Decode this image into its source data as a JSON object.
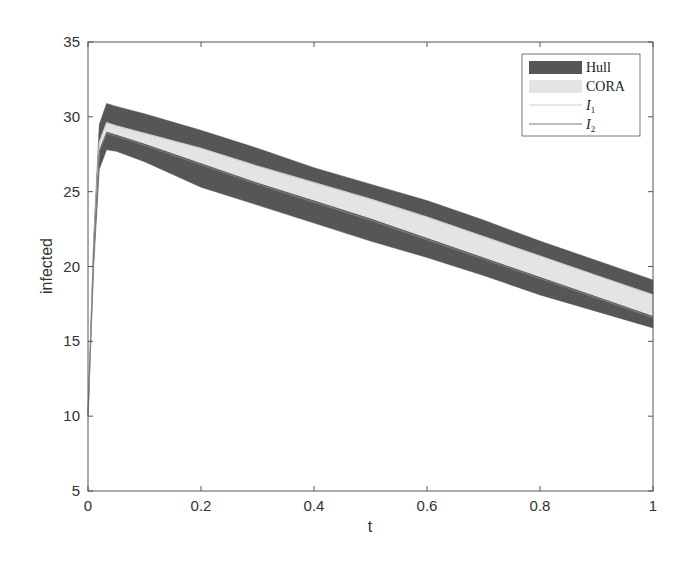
{
  "chart_data": {
    "type": "area",
    "title": "",
    "xlabel": "t",
    "ylabel": "infected",
    "xlim": [
      0,
      1
    ],
    "ylim": [
      5,
      35
    ],
    "xticks": [
      "0",
      "0.2",
      "0.4",
      "0.6",
      "0.8",
      "1"
    ],
    "yticks": [
      "5",
      "10",
      "15",
      "20",
      "25",
      "30",
      "35"
    ],
    "grid": false,
    "legend_position": "upper right",
    "legend": [
      {
        "label": "Hull",
        "style": "fill",
        "color": "#555555"
      },
      {
        "label": "CORA",
        "style": "fill",
        "color": "#e3e3e3"
      },
      {
        "label": "I",
        "subscript": "1",
        "style": "line",
        "color": "#c8c8c8"
      },
      {
        "label": "I",
        "subscript": "2",
        "style": "line",
        "color": "#777777"
      }
    ],
    "x": [
      0,
      0.01,
      0.02,
      0.033,
      0.05,
      0.1,
      0.2,
      0.3,
      0.4,
      0.5,
      0.6,
      0.7,
      0.8,
      0.9,
      1.0
    ],
    "series": [
      {
        "name": "Hull upper",
        "values": [
          10,
          22,
          29.5,
          30.9,
          30.7,
          30.2,
          29.1,
          27.9,
          26.6,
          25.5,
          24.4,
          23.1,
          21.7,
          20.4,
          19.1
        ]
      },
      {
        "name": "Hull lower",
        "values": [
          10,
          20,
          26.5,
          27.8,
          27.7,
          27.0,
          25.3,
          24.1,
          22.9,
          21.7,
          20.6,
          19.4,
          18.1,
          17.0,
          15.9
        ]
      },
      {
        "name": "CORA upper",
        "values": [
          10,
          21.3,
          28.3,
          29.6,
          29.4,
          28.9,
          27.9,
          26.7,
          25.6,
          24.5,
          23.3,
          22.0,
          20.7,
          19.4,
          18.1
        ]
      },
      {
        "name": "CORA lower",
        "values": [
          10,
          21.0,
          27.8,
          29.0,
          28.8,
          28.2,
          26.9,
          25.6,
          24.4,
          23.2,
          21.9,
          20.6,
          19.3,
          18.0,
          16.7
        ]
      },
      {
        "name": "I1",
        "values": [
          10,
          21.3,
          28.3,
          29.6,
          29.4,
          28.9,
          27.9,
          26.7,
          25.6,
          24.5,
          23.3,
          22.0,
          20.7,
          19.4,
          18.1
        ]
      },
      {
        "name": "I2",
        "values": [
          10,
          21.0,
          27.7,
          28.9,
          28.7,
          28.1,
          26.8,
          25.5,
          24.3,
          23.1,
          21.8,
          20.5,
          19.2,
          17.9,
          16.6
        ]
      }
    ]
  },
  "colors": {
    "hull": "#565656",
    "cora": "#e4e4e4",
    "i1": "#cfcfcf",
    "i2": "#7a7a7a",
    "axis": "#555555"
  }
}
